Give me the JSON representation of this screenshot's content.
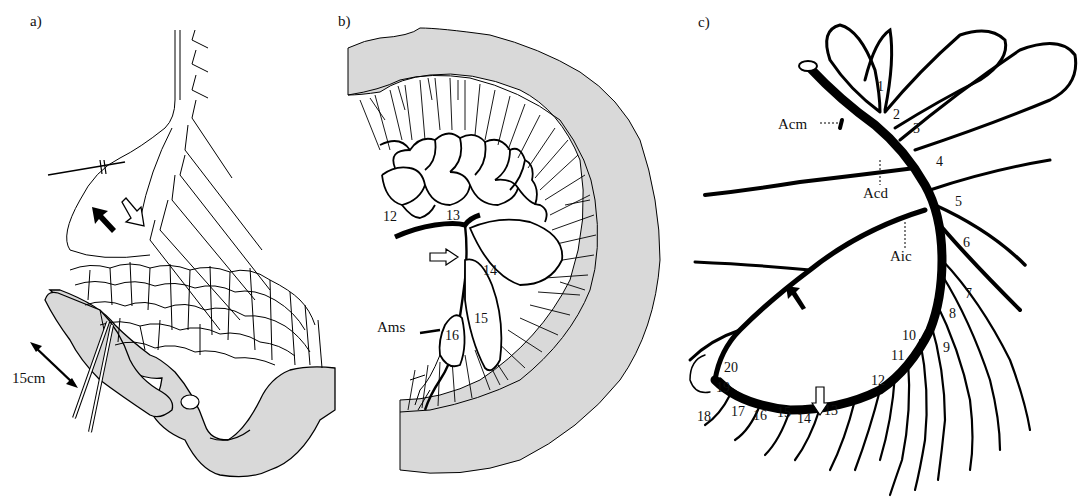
{
  "figure": {
    "panels": [
      {
        "id": "a",
        "label": "a)",
        "annotations": {
          "scale": "15cm"
        },
        "arrows": [
          {
            "style": "filled",
            "direction": "up-left"
          },
          {
            "style": "outline",
            "direction": "down-right"
          }
        ]
      },
      {
        "id": "b",
        "label": "b)",
        "vessel_numbers": [
          "12",
          "13",
          "14",
          "15",
          "16"
        ],
        "annotations": {
          "artery": "Ams"
        },
        "arrows": [
          {
            "style": "outline",
            "direction": "right"
          }
        ]
      },
      {
        "id": "c",
        "label": "c)",
        "vessel_numbers": [
          "1",
          "2",
          "3",
          "4",
          "5",
          "6",
          "7",
          "8",
          "9",
          "10",
          "11",
          "12",
          "13",
          "14",
          "15",
          "16",
          "17",
          "18",
          "19",
          "20"
        ],
        "annotations": {
          "acm": "Acm",
          "acd": "Acd",
          "aic": "Aic"
        },
        "arrows": [
          {
            "style": "filled",
            "direction": "up-left"
          },
          {
            "style": "outline",
            "direction": "down"
          }
        ]
      }
    ],
    "colors": {
      "tissue_fill": "#d9d9d9",
      "vessel": "#000000",
      "background": "#ffffff"
    }
  }
}
